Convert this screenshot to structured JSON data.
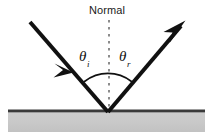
{
  "figure": {
    "kind": "physics-diagram",
    "width": 214,
    "height": 139,
    "background_color": "#ffffff"
  },
  "labels": {
    "normal": "Normal",
    "theta_incident": {
      "symbol": "θ",
      "subscript": "i",
      "full": "θi"
    },
    "theta_reflected": {
      "symbol": "θ",
      "subscript": "r",
      "full": "θr"
    }
  },
  "colors": {
    "ray_stroke": "#111111",
    "surface_line": "#3a3a3a",
    "surface_fill": "#c9c9c9",
    "surface_fill_edge": "#bdbdbd",
    "normal_dash": "#8c8c8c",
    "arc_stroke": "#111111",
    "text": "#1a1a1a"
  },
  "geometry": {
    "vertex": {
      "x": 108,
      "y": 112
    },
    "incident_ray": {
      "from": {
        "x": 30,
        "y": 22
      },
      "to": {
        "x": 108,
        "y": 112
      },
      "arrowhead_at": {
        "x": 72,
        "y": 70
      },
      "stroke_width": 4
    },
    "reflected_ray": {
      "from": {
        "x": 108,
        "y": 112
      },
      "to": {
        "x": 184,
        "y": 23
      },
      "arrowhead_at": {
        "x": 184,
        "y": 23
      },
      "stroke_width": 4
    },
    "normal_line": {
      "from": {
        "x": 109,
        "y": 20
      },
      "to": {
        "x": 109,
        "y": 113
      },
      "dash": "2,4",
      "stroke_width": 2
    },
    "angle_arc": {
      "center": {
        "x": 108,
        "y": 112
      },
      "radius": 38,
      "left_end": {
        "x": 85,
        "y": 82
      },
      "right_end": {
        "x": 131,
        "y": 82
      },
      "stroke_width": 1.6
    },
    "surface": {
      "left": 8,
      "right": 205,
      "top_line_y": 111,
      "band_top": 113,
      "band_bottom": 132,
      "line_thickness": 3
    }
  }
}
